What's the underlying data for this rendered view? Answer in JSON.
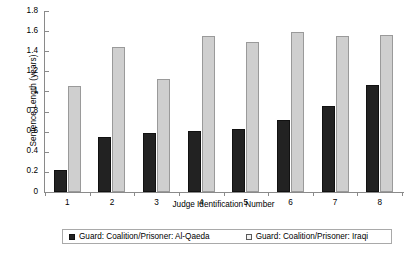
{
  "chart_data": {
    "type": "bar",
    "title": "",
    "xlabel": "Judge Identification Number",
    "ylabel": "Sentence Length (years)",
    "categories": [
      "1",
      "2",
      "3",
      "4",
      "5",
      "6",
      "7",
      "8"
    ],
    "ylim": [
      0,
      1.8
    ],
    "yticks": [
      "0",
      "0.2",
      "0.4",
      "0.6",
      "0.8",
      "1",
      "1.2",
      "1.4",
      "1.6",
      "1.8"
    ],
    "ytick_values": [
      0,
      0.2,
      0.4,
      0.6,
      0.8,
      1.0,
      1.2,
      1.4,
      1.6,
      1.8
    ],
    "grid": false,
    "legend_position": "bottom",
    "series": [
      {
        "name": "Guard: Coalition/Prisoner: Al-Qaeda",
        "color": "#222222",
        "values": [
          0.22,
          0.55,
          0.59,
          0.61,
          0.63,
          0.72,
          0.86,
          1.06
        ]
      },
      {
        "name": "Guard: Coalition/Prisoner: Iraqi",
        "color": "#cfcfcf",
        "values": [
          1.05,
          1.44,
          1.12,
          1.55,
          1.49,
          1.59,
          1.55,
          1.56
        ]
      }
    ]
  }
}
